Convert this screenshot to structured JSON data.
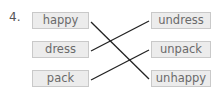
{
  "question_number": "4.",
  "left_words": [
    "happy",
    "dress",
    "pack"
  ],
  "right_words": [
    "undress",
    "unpack",
    "unhappy"
  ],
  "connections": [
    {
      "from": "happy",
      "to": "unhappy"
    },
    {
      "from": "dress",
      "to": "undress"
    },
    {
      "from": "pack",
      "to": "unpack"
    }
  ]
}
